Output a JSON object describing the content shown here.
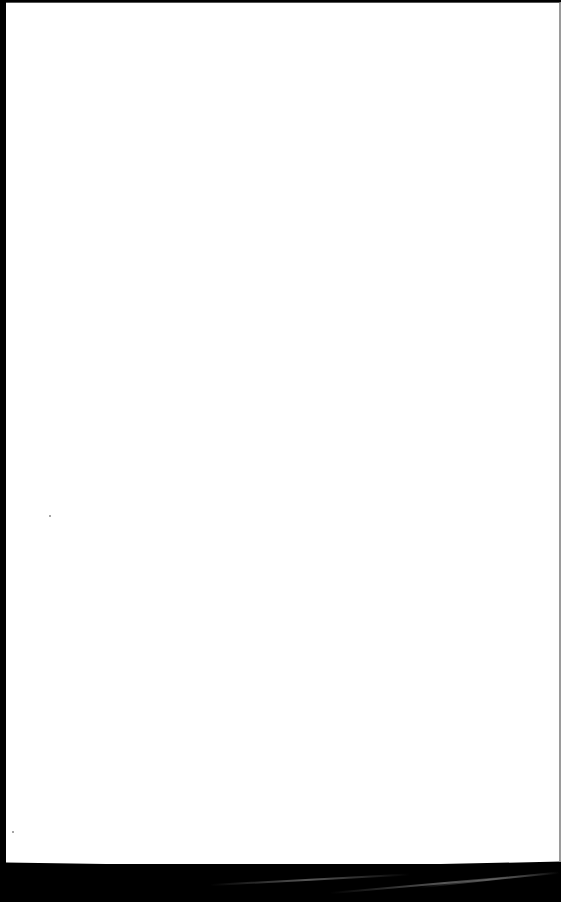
{
  "document": {
    "type": "scanned-page",
    "content": "",
    "colors": {
      "paper": "#ffffff",
      "scan_background": "#000000",
      "edge_shadow": "#9a9a9a"
    }
  }
}
